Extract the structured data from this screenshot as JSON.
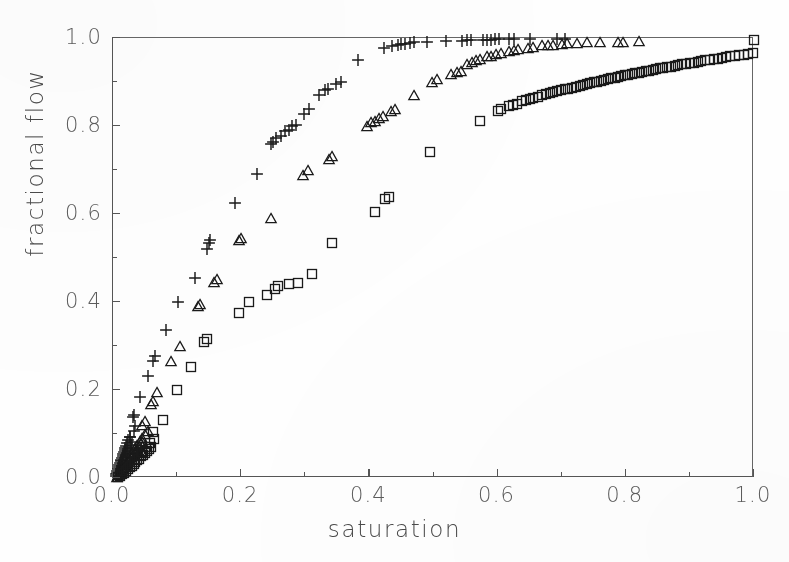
{
  "figure": {
    "background_color": "#ffffff",
    "ink_color": "#2b2b2b",
    "axis_color": "#555555",
    "label_color": "#5c5c5c"
  },
  "axes": {
    "x_title": "saturation",
    "y_title": "fractional flow",
    "x_ticklabels": [
      "0.0",
      "0.2",
      "0.4",
      "0.6",
      "0.8",
      "1.0"
    ],
    "y_ticklabels": [
      "0.0",
      "0.2",
      "0.4",
      "0.6",
      "0.8",
      "1.0"
    ],
    "x_major_ticks": [
      0.0,
      0.2,
      0.4,
      0.6,
      0.8,
      1.0
    ],
    "y_major_ticks": [
      0.0,
      0.2,
      0.4,
      0.6,
      0.8,
      1.0
    ],
    "x_minor_ticks": [
      0.1,
      0.3,
      0.5,
      0.7,
      0.9
    ],
    "y_minor_ticks": [
      0.1,
      0.3,
      0.5,
      0.7,
      0.9
    ]
  },
  "chart_data": {
    "type": "scatter",
    "title": "",
    "xlabel": "saturation",
    "ylabel": "fractional flow",
    "xlim": [
      0.0,
      1.0
    ],
    "ylim": [
      0.0,
      1.0
    ],
    "grid": false,
    "legend": "none",
    "series": [
      {
        "name": "plus-series",
        "marker": "plus",
        "color": "#1a1a1a",
        "points": [
          [
            0.004,
            0.004
          ],
          [
            0.005,
            0.008
          ],
          [
            0.006,
            0.012
          ],
          [
            0.007,
            0.016
          ],
          [
            0.008,
            0.021
          ],
          [
            0.009,
            0.026
          ],
          [
            0.01,
            0.03
          ],
          [
            0.011,
            0.034
          ],
          [
            0.012,
            0.038
          ],
          [
            0.013,
            0.042
          ],
          [
            0.014,
            0.046
          ],
          [
            0.015,
            0.05
          ],
          [
            0.016,
            0.055
          ],
          [
            0.017,
            0.06
          ],
          [
            0.018,
            0.064
          ],
          [
            0.019,
            0.068
          ],
          [
            0.02,
            0.072
          ],
          [
            0.022,
            0.079
          ],
          [
            0.024,
            0.086
          ],
          [
            0.026,
            0.093
          ],
          [
            0.012,
            0.02
          ],
          [
            0.014,
            0.028
          ],
          [
            0.016,
            0.034
          ],
          [
            0.018,
            0.041
          ],
          [
            0.02,
            0.048
          ],
          [
            0.022,
            0.055
          ],
          [
            0.024,
            0.061
          ],
          [
            0.026,
            0.068
          ],
          [
            0.028,
            0.075
          ],
          [
            0.03,
            0.082
          ],
          [
            0.027,
            0.093
          ],
          [
            0.032,
            0.106
          ],
          [
            0.035,
            0.118
          ],
          [
            0.031,
            0.139
          ],
          [
            0.033,
            0.143
          ],
          [
            0.042,
            0.183
          ],
          [
            0.054,
            0.232
          ],
          [
            0.062,
            0.265
          ],
          [
            0.066,
            0.277
          ],
          [
            0.082,
            0.337
          ],
          [
            0.101,
            0.4
          ],
          [
            0.128,
            0.455
          ],
          [
            0.147,
            0.52
          ],
          [
            0.15,
            0.534
          ],
          [
            0.152,
            0.541
          ],
          [
            0.19,
            0.624
          ],
          [
            0.225,
            0.692
          ],
          [
            0.247,
            0.758
          ],
          [
            0.25,
            0.764
          ],
          [
            0.254,
            0.772
          ],
          [
            0.262,
            0.778
          ],
          [
            0.268,
            0.788
          ],
          [
            0.274,
            0.792
          ],
          [
            0.28,
            0.799
          ],
          [
            0.285,
            0.802
          ],
          [
            0.298,
            0.828
          ],
          [
            0.305,
            0.838
          ],
          [
            0.322,
            0.87
          ],
          [
            0.33,
            0.882
          ],
          [
            0.336,
            0.884
          ],
          [
            0.348,
            0.896
          ],
          [
            0.356,
            0.899
          ],
          [
            0.382,
            0.95
          ],
          [
            0.423,
            0.978
          ],
          [
            0.436,
            0.982
          ],
          [
            0.444,
            0.985
          ],
          [
            0.45,
            0.986
          ],
          [
            0.456,
            0.987
          ],
          [
            0.464,
            0.989
          ],
          [
            0.47,
            0.99
          ],
          [
            0.49,
            0.992
          ],
          [
            0.52,
            0.993
          ],
          [
            0.545,
            0.994
          ],
          [
            0.552,
            0.995
          ],
          [
            0.558,
            0.995
          ],
          [
            0.578,
            0.996
          ],
          [
            0.584,
            0.996
          ],
          [
            0.59,
            0.996
          ],
          [
            0.596,
            0.997
          ],
          [
            0.602,
            0.997
          ],
          [
            0.618,
            0.997
          ],
          [
            0.626,
            0.997
          ],
          [
            0.65,
            0.998
          ],
          [
            0.692,
            0.998
          ],
          [
            0.705,
            0.998
          ]
        ]
      },
      {
        "name": "triangle-series",
        "marker": "triangle",
        "color": "#1a1a1a",
        "points": [
          [
            0.006,
            0.003
          ],
          [
            0.008,
            0.006
          ],
          [
            0.01,
            0.01
          ],
          [
            0.012,
            0.014
          ],
          [
            0.014,
            0.018
          ],
          [
            0.016,
            0.022
          ],
          [
            0.018,
            0.026
          ],
          [
            0.02,
            0.03
          ],
          [
            0.022,
            0.034
          ],
          [
            0.024,
            0.038
          ],
          [
            0.026,
            0.043
          ],
          [
            0.028,
            0.047
          ],
          [
            0.03,
            0.051
          ],
          [
            0.032,
            0.055
          ],
          [
            0.034,
            0.059
          ],
          [
            0.036,
            0.063
          ],
          [
            0.038,
            0.067
          ],
          [
            0.04,
            0.072
          ],
          [
            0.043,
            0.078
          ],
          [
            0.046,
            0.084
          ],
          [
            0.03,
            0.06
          ],
          [
            0.034,
            0.068
          ],
          [
            0.038,
            0.076
          ],
          [
            0.042,
            0.084
          ],
          [
            0.046,
            0.092
          ],
          [
            0.05,
            0.1
          ],
          [
            0.054,
            0.107
          ],
          [
            0.046,
            0.12
          ],
          [
            0.05,
            0.13
          ],
          [
            0.06,
            0.168
          ],
          [
            0.063,
            0.175
          ],
          [
            0.069,
            0.195
          ],
          [
            0.09,
            0.265
          ],
          [
            0.105,
            0.3
          ],
          [
            0.133,
            0.39
          ],
          [
            0.136,
            0.396
          ],
          [
            0.158,
            0.445
          ],
          [
            0.163,
            0.452
          ],
          [
            0.196,
            0.54
          ],
          [
            0.2,
            0.546
          ],
          [
            0.247,
            0.592
          ],
          [
            0.296,
            0.688
          ],
          [
            0.304,
            0.7
          ],
          [
            0.337,
            0.726
          ],
          [
            0.342,
            0.732
          ],
          [
            0.397,
            0.8
          ],
          [
            0.403,
            0.808
          ],
          [
            0.409,
            0.812
          ],
          [
            0.415,
            0.818
          ],
          [
            0.421,
            0.822
          ],
          [
            0.433,
            0.834
          ],
          [
            0.44,
            0.838
          ],
          [
            0.47,
            0.87
          ],
          [
            0.498,
            0.9
          ],
          [
            0.505,
            0.906
          ],
          [
            0.528,
            0.918
          ],
          [
            0.536,
            0.922
          ],
          [
            0.543,
            0.925
          ],
          [
            0.552,
            0.94
          ],
          [
            0.56,
            0.946
          ],
          [
            0.566,
            0.949
          ],
          [
            0.573,
            0.952
          ],
          [
            0.583,
            0.958
          ],
          [
            0.59,
            0.96
          ],
          [
            0.598,
            0.963
          ],
          [
            0.605,
            0.965
          ],
          [
            0.618,
            0.97
          ],
          [
            0.625,
            0.972
          ],
          [
            0.632,
            0.974
          ],
          [
            0.648,
            0.978
          ],
          [
            0.656,
            0.98
          ],
          [
            0.67,
            0.983
          ],
          [
            0.678,
            0.984
          ],
          [
            0.686,
            0.985
          ],
          [
            0.7,
            0.987
          ],
          [
            0.708,
            0.988
          ],
          [
            0.724,
            0.989
          ],
          [
            0.74,
            0.99
          ],
          [
            0.76,
            0.991
          ],
          [
            0.788,
            0.992
          ],
          [
            0.796,
            0.992
          ],
          [
            0.82,
            0.993
          ]
        ]
      },
      {
        "name": "square-series",
        "marker": "square",
        "color": "#1a1a1a",
        "points": [
          [
            0.008,
            0.002
          ],
          [
            0.011,
            0.005
          ],
          [
            0.014,
            0.008
          ],
          [
            0.017,
            0.012
          ],
          [
            0.02,
            0.016
          ],
          [
            0.023,
            0.02
          ],
          [
            0.026,
            0.024
          ],
          [
            0.029,
            0.028
          ],
          [
            0.032,
            0.032
          ],
          [
            0.035,
            0.036
          ],
          [
            0.038,
            0.04
          ],
          [
            0.041,
            0.044
          ],
          [
            0.044,
            0.049
          ],
          [
            0.047,
            0.053
          ],
          [
            0.05,
            0.057
          ],
          [
            0.053,
            0.061
          ],
          [
            0.056,
            0.065
          ],
          [
            0.06,
            0.07
          ],
          [
            0.046,
            0.06
          ],
          [
            0.052,
            0.07
          ],
          [
            0.058,
            0.08
          ],
          [
            0.064,
            0.089
          ],
          [
            0.062,
            0.105
          ],
          [
            0.078,
            0.132
          ],
          [
            0.1,
            0.2
          ],
          [
            0.122,
            0.252
          ],
          [
            0.142,
            0.31
          ],
          [
            0.146,
            0.316
          ],
          [
            0.196,
            0.375
          ],
          [
            0.212,
            0.4
          ],
          [
            0.24,
            0.417
          ],
          [
            0.252,
            0.43
          ],
          [
            0.258,
            0.436
          ],
          [
            0.274,
            0.442
          ],
          [
            0.288,
            0.443
          ],
          [
            0.31,
            0.464
          ],
          [
            0.342,
            0.533
          ],
          [
            0.408,
            0.604
          ],
          [
            0.424,
            0.634
          ],
          [
            0.43,
            0.638
          ],
          [
            0.495,
            0.742
          ],
          [
            0.573,
            0.812
          ],
          [
            0.6,
            0.835
          ],
          [
            0.606,
            0.838
          ],
          [
            0.618,
            0.845
          ],
          [
            0.624,
            0.848
          ],
          [
            0.63,
            0.851
          ],
          [
            0.638,
            0.856
          ],
          [
            0.644,
            0.859
          ],
          [
            0.65,
            0.861
          ],
          [
            0.656,
            0.864
          ],
          [
            0.663,
            0.867
          ],
          [
            0.669,
            0.87
          ],
          [
            0.675,
            0.872
          ],
          [
            0.681,
            0.874
          ],
          [
            0.687,
            0.877
          ],
          [
            0.693,
            0.879
          ],
          [
            0.699,
            0.881
          ],
          [
            0.705,
            0.883
          ],
          [
            0.71,
            0.885
          ],
          [
            0.716,
            0.887
          ],
          [
            0.722,
            0.889
          ],
          [
            0.728,
            0.891
          ],
          [
            0.733,
            0.893
          ],
          [
            0.739,
            0.895
          ],
          [
            0.744,
            0.897
          ],
          [
            0.75,
            0.899
          ],
          [
            0.755,
            0.901
          ],
          [
            0.761,
            0.903
          ],
          [
            0.766,
            0.905
          ],
          [
            0.772,
            0.906
          ],
          [
            0.777,
            0.908
          ],
          [
            0.783,
            0.91
          ],
          [
            0.788,
            0.912
          ],
          [
            0.793,
            0.913
          ],
          [
            0.799,
            0.915
          ],
          [
            0.804,
            0.917
          ],
          [
            0.809,
            0.918
          ],
          [
            0.815,
            0.92
          ],
          [
            0.82,
            0.921
          ],
          [
            0.826,
            0.923
          ],
          [
            0.831,
            0.925
          ],
          [
            0.836,
            0.926
          ],
          [
            0.842,
            0.928
          ],
          [
            0.847,
            0.929
          ],
          [
            0.853,
            0.931
          ],
          [
            0.858,
            0.932
          ],
          [
            0.864,
            0.934
          ],
          [
            0.87,
            0.935
          ],
          [
            0.876,
            0.937
          ],
          [
            0.882,
            0.938
          ],
          [
            0.888,
            0.94
          ],
          [
            0.894,
            0.941
          ],
          [
            0.9,
            0.943
          ],
          [
            0.906,
            0.944
          ],
          [
            0.912,
            0.946
          ],
          [
            0.918,
            0.947
          ],
          [
            0.924,
            0.949
          ],
          [
            0.931,
            0.95
          ],
          [
            0.937,
            0.952
          ],
          [
            0.944,
            0.953
          ],
          [
            0.95,
            0.955
          ],
          [
            0.957,
            0.956
          ],
          [
            0.963,
            0.958
          ],
          [
            0.97,
            0.959
          ],
          [
            0.977,
            0.961
          ],
          [
            0.984,
            0.962
          ],
          [
            0.991,
            0.964
          ],
          [
            0.998,
            0.965
          ],
          [
            1.0,
            0.996
          ]
        ]
      }
    ]
  }
}
